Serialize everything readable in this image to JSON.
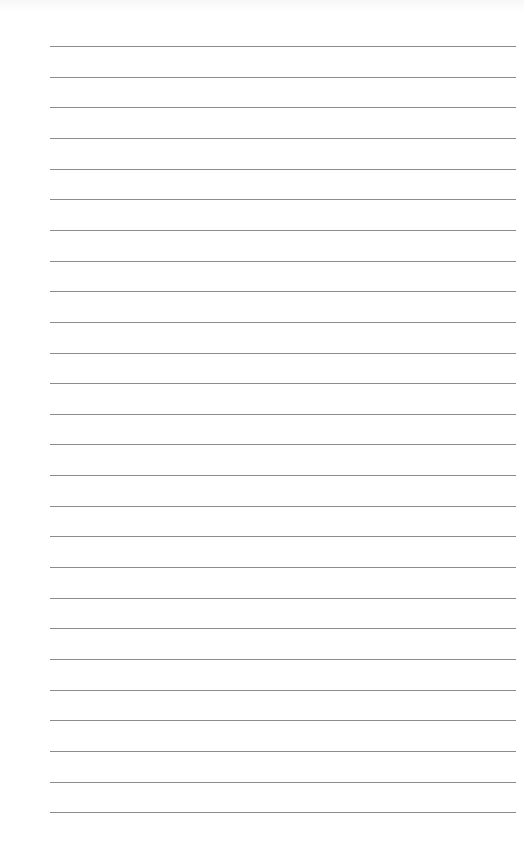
{
  "paper": {
    "type": "lined-paper",
    "line_count": 26,
    "first_line_y": 46,
    "line_spacing": 30.65,
    "line_left": 50,
    "line_width": 466,
    "line_color": "#8c8c8c",
    "background_color": "#ffffff"
  }
}
